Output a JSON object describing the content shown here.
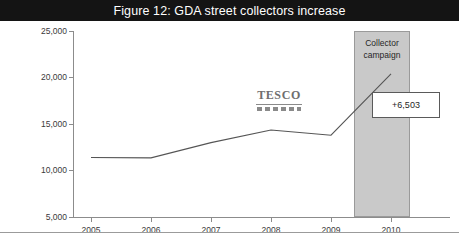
{
  "figure": {
    "title": "Figure 12: GDA street collectors increase",
    "title_bar_color": "#141414",
    "title_text_color": "#ffffff",
    "background": "#ffffff"
  },
  "watermark": {
    "text": "TESCO",
    "color": "#6e6e6e"
  },
  "annotations": {
    "band_label_line1": "Collector",
    "band_label_line2": "campaign",
    "band_color": "#c9c9c9",
    "callout_value": "+6,503",
    "callout_border_color": "#5a5a5a"
  },
  "chart_data": {
    "type": "line",
    "title": "Figure 12: GDA street collectors increase",
    "xlabel": "",
    "ylabel": "",
    "x": [
      "2005",
      "2006",
      "2007",
      "2008",
      "2009",
      "2010"
    ],
    "categories": [
      "2005",
      "2006",
      "2007",
      "2008",
      "2009",
      "2010"
    ],
    "values": [
      11400,
      11350,
      13000,
      14350,
      13800,
      20400
    ],
    "series": [
      {
        "name": "GDA street collectors",
        "values": [
          11400,
          11350,
          13000,
          14350,
          13800,
          20400
        ]
      }
    ],
    "ylim": [
      5000,
      25000
    ],
    "yticks": [
      5000,
      10000,
      15000,
      20000,
      25000
    ],
    "ytick_labels": [
      "5,000",
      "10,000",
      "15,000",
      "20,000",
      "25,000"
    ],
    "xtick_labels": [
      "2005",
      "2006",
      "2007",
      "2008",
      "2009",
      "2010"
    ],
    "grid": false,
    "legend": "none",
    "line_color": "#555555",
    "shaded_region": {
      "label": "Collector campaign",
      "from": "2009.5",
      "to": "2010.4",
      "color": "#c9c9c9"
    },
    "annotation": {
      "text": "+6,503",
      "describes": "increase from 2009 to 2010"
    }
  }
}
